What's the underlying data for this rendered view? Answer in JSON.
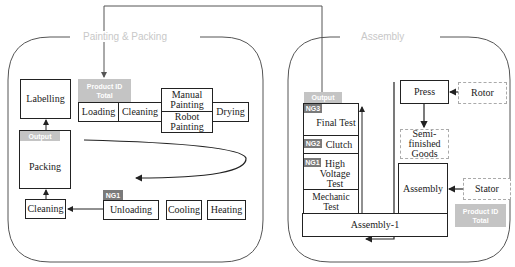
{
  "frames": {
    "left": {
      "title": "Painting & Packing"
    },
    "right": {
      "title": "Assembly"
    }
  },
  "left": {
    "labelling": "Labelling",
    "packing": "Packing",
    "output_tag": "Output",
    "cleaning_bottom": "Cleaning",
    "product_tag": {
      "line1": "Product ID",
      "line2": "Total"
    },
    "loading": "Loading",
    "cleaning_top": "Cleaning",
    "manual_painting": "Manual Painting",
    "robot_painting": "Robot Painting",
    "drying": "Drying",
    "ng1_tag": "NG1",
    "unloading": "Unloading",
    "cooling": "Cooling",
    "heating": "Heating"
  },
  "right": {
    "output_tag": "Output",
    "ng3_tag": "NG3",
    "final_test": "Final Test",
    "ng2_tag": "NG2",
    "clutch": "Clutch",
    "ng1_tag": "NG1",
    "high_voltage_test": "High Voltage Test",
    "mechanic_test": "Mechanic Test",
    "assembly_1": "Assembly-1",
    "press": "Press",
    "rotor": "Rotor",
    "semi_finished": "Semi-finished Goods",
    "assembly": "Assembly",
    "stator": "Stator",
    "product_tag": {
      "line1": "Product ID",
      "line2": "Total"
    }
  },
  "colors": {
    "line": "#222222",
    "tag_light": "#c4c4c4",
    "tag_dark": "#7a7a7a",
    "frame": "#555555",
    "title": "#c8c8c8"
  }
}
